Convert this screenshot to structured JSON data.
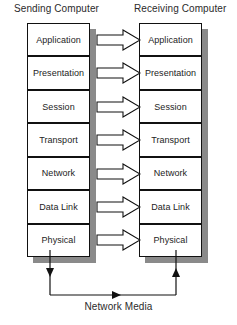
{
  "diagram": {
    "headings": {
      "sending": "Sending Computer",
      "receiving": "Receiving Computer"
    },
    "layers": [
      "Application",
      "Presentation",
      "Session",
      "Transport",
      "Network",
      "Data Link",
      "Physical"
    ],
    "sending_layers": [
      "Application",
      "Presentation",
      "Session",
      "Transport",
      "Network",
      "Data Link",
      "Physical"
    ],
    "receiving_layers": [
      "Application",
      "Presentation",
      "Session",
      "Transport",
      "Network",
      "Data Link",
      "Physical"
    ],
    "arrows": {
      "count": 7,
      "direction": "left-to-right",
      "style": "block-arrow",
      "fill": "#ffffff",
      "stroke": "#111111"
    },
    "media": {
      "label": "Network Media",
      "flow": "sending-physical to receiving-physical",
      "stroke": "#111111"
    },
    "colors": {
      "background": "#ffffff",
      "box_fill": "#ffffff",
      "box_border": "#111111",
      "shadow": "#8a8a8a",
      "text": "#232323"
    }
  }
}
